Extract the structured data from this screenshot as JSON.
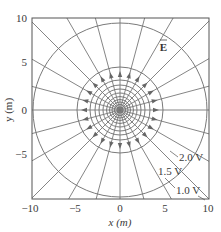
{
  "figure": {
    "title": "",
    "xlabel": "x (m)",
    "ylabel": "y (m)",
    "x_ticks": [
      "−10",
      "−5",
      "0",
      "5",
      "10"
    ],
    "y_ticks": [
      "10",
      "5",
      "0",
      "−5"
    ],
    "field_label": "E",
    "equipotential_labels": [
      "2.0 V",
      "1.5 V",
      "1.0 V"
    ],
    "colors": {
      "lines": "#777777",
      "frame": "#555555",
      "text": "#3a3a3a",
      "background": "#ffffff"
    }
  },
  "chart_data": {
    "type": "diagram",
    "title": "",
    "xlabel": "x (m)",
    "ylabel": "y (m)",
    "xlim": [
      -10,
      10
    ],
    "ylim": [
      -10,
      10
    ],
    "x_ticks": [
      -10,
      -5,
      0,
      5,
      10
    ],
    "y_ticks": [
      -5,
      0,
      5,
      10
    ],
    "field_lines": {
      "count": 24,
      "direction": "outward",
      "label": "E (vector)"
    },
    "equipotentials": [
      {
        "label": "2.0 V",
        "radius_m": 5.0
      },
      {
        "label": "1.5 V",
        "radius_m": 6.7
      },
      {
        "label": "1.0 V",
        "radius_m": 10.0
      }
    ]
  }
}
